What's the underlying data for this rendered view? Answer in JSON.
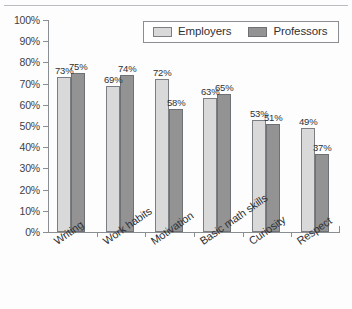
{
  "chart_data": {
    "type": "bar",
    "title": "",
    "xlabel": "",
    "ylabel": "",
    "ylim": [
      0,
      100
    ],
    "ytick_labels": [
      "100%",
      "90%",
      "80%",
      "70%",
      "60%",
      "50%",
      "40%",
      "30%",
      "20%",
      "10%",
      "0%"
    ],
    "ytick_values": [
      100,
      90,
      80,
      70,
      60,
      50,
      40,
      30,
      20,
      10,
      0
    ],
    "grid": false,
    "legend_position": "top-right-inside",
    "categories": [
      "Writing",
      "Work habits",
      "Motivation",
      "Basic math skills",
      "Curiosity",
      "Respect"
    ],
    "series": [
      {
        "name": "Employers",
        "color": "#d9d9d9",
        "values": [
          73,
          69,
          72,
          63,
          53,
          49
        ],
        "labels": [
          "73%",
          "69%",
          "72%",
          "63%",
          "53%",
          "49%"
        ]
      },
      {
        "name": "Professors",
        "color": "#939393",
        "values": [
          75,
          74,
          58,
          65,
          51,
          37
        ],
        "labels": [
          "75%",
          "74%",
          "58%",
          "65%",
          "51%",
          "37%"
        ]
      }
    ]
  },
  "legend": {
    "entries": [
      {
        "label": "Employers"
      },
      {
        "label": "Professors"
      }
    ]
  }
}
